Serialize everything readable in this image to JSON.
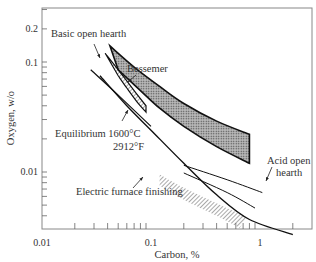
{
  "chart_data": {
    "type": "line",
    "title": "",
    "xlabel": "Carbon, %",
    "ylabel": "Oxygen, w/o",
    "xscale": "log",
    "yscale": "log",
    "xlim": [
      0.01,
      2.5
    ],
    "ylim": [
      0.0027,
      0.3
    ],
    "grid": false,
    "legend": "none (inline annotations)",
    "x_ticks": [
      {
        "value": 0.01,
        "label": "0.01"
      },
      {
        "value": 0.1,
        "label": "0.1"
      },
      {
        "value": 1,
        "label": "1"
      }
    ],
    "y_ticks": [
      {
        "value": 0.01,
        "label": "0.01"
      },
      {
        "value": 0.1,
        "label": "0.1"
      },
      {
        "value": 0.2,
        "label": "0.2"
      }
    ],
    "series": [
      {
        "name": "Equilibrium 1600°C / 2912°F",
        "style": "solid line",
        "points": [
          [
            0.034,
            0.075
          ],
          [
            0.06,
            0.04
          ],
          [
            0.1,
            0.024
          ],
          [
            0.2,
            0.012
          ],
          [
            0.4,
            0.0062
          ],
          [
            0.8,
            0.0037
          ],
          [
            2.0,
            0.0027
          ]
        ]
      },
      {
        "name": "Basic open hearth",
        "style": "hatched band",
        "upper": [
          [
            0.038,
            0.12
          ],
          [
            0.05,
            0.085
          ],
          [
            0.07,
            0.055
          ],
          [
            0.09,
            0.04
          ]
        ],
        "lower": [
          [
            0.05,
            0.075
          ],
          [
            0.06,
            0.058
          ],
          [
            0.075,
            0.043
          ],
          [
            0.09,
            0.035
          ]
        ]
      },
      {
        "name": "Bessemer",
        "style": "dotted dark band",
        "upper": [
          [
            0.042,
            0.14
          ],
          [
            0.07,
            0.09
          ],
          [
            0.12,
            0.06
          ],
          [
            0.2,
            0.042
          ],
          [
            0.4,
            0.029
          ],
          [
            0.8,
            0.022
          ]
        ],
        "lower": [
          [
            0.05,
            0.085
          ],
          [
            0.08,
            0.055
          ],
          [
            0.12,
            0.038
          ],
          [
            0.2,
            0.026
          ],
          [
            0.4,
            0.017
          ],
          [
            0.8,
            0.012
          ]
        ]
      },
      {
        "name": "Acid open hearth",
        "style": "two solid lines",
        "lines": [
          [
            [
              0.2,
              0.0115
            ],
            [
              0.5,
              0.0085
            ],
            [
              1.05,
              0.0065
            ]
          ],
          [
            [
              0.2,
              0.0098
            ],
            [
              0.5,
              0.0065
            ],
            [
              0.9,
              0.0047
            ]
          ]
        ]
      },
      {
        "name": "Electric furnace finishing",
        "style": "hatched band",
        "upper": [
          [
            0.12,
            0.0095
          ],
          [
            0.2,
            0.0072
          ],
          [
            0.4,
            0.0052
          ],
          [
            0.75,
            0.0039
          ]
        ],
        "lower": [
          [
            0.12,
            0.0075
          ],
          [
            0.2,
            0.0056
          ],
          [
            0.4,
            0.004
          ],
          [
            0.65,
            0.0031
          ]
        ]
      }
    ],
    "annotations": [
      {
        "text": "Basic open hearth",
        "x": 0.012,
        "y": 0.17
      },
      {
        "text": "Bessemer",
        "x": 0.095,
        "y": 0.095
      },
      {
        "text": "Equilibrium 1600°C",
        "x": 0.028,
        "y": 0.018
      },
      {
        "text": "2912°F",
        "x": 0.06,
        "y": 0.0145
      },
      {
        "text": "Acid open hearth",
        "x": 1.05,
        "y": 0.0085
      },
      {
        "text": "Electric furnace finishing",
        "x": 0.05,
        "y": 0.0058
      }
    ]
  },
  "labels": {
    "xlabel": "Carbon, %",
    "ylabel": "Oxygen, w/o",
    "x_tick_001": "0.01",
    "x_tick_01": "0.1",
    "x_tick_1": "1",
    "y_tick_001": "0.01",
    "y_tick_01": "0.1",
    "y_tick_02": "0.2",
    "basic_open_hearth": "Basic open hearth",
    "bessemer": "Bessemer",
    "equilibrium_line1": "Equilibrium 1600°C",
    "equilibrium_line2": "2912°F",
    "acid_open_hearth_line1": "Acid open",
    "acid_open_hearth_line2": "hearth",
    "electric_furnace": "Electric furnace finishing"
  }
}
